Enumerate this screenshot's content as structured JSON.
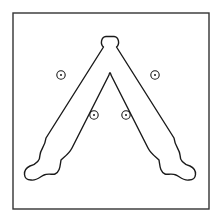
{
  "diagram": {
    "type": "technical-line-drawing",
    "canvas": {
      "width": 219,
      "height": 219,
      "background": "#ffffff"
    },
    "stroke_color": "#1a1a1a",
    "frame": {
      "x": 13,
      "y": 13,
      "width": 196,
      "height": 196,
      "stroke_width": 1.4,
      "stroke_color": "#333333"
    },
    "part_outline": {
      "stroke_width": 1.4,
      "path": "M 103.5 47 C 100 44 101 37 106 36.5 L 114 36.5 C 119 37 120 44 116.5 47 L 174 138 C 175 147 180 150 180 155 C 180 160 183 164 190 166 C 198 170 197 180 189 180 C 183 181 179 176 176 175 C 172 173 167 175 165 174 C 160 172 160 166 159 160 C 156 157 151 154 148 148 L 111 75 C 110.5 72 109.5 72 109 75 L 72 148 C 69 154 64 157 61 160 C 60 166 60 172 55 174 C 53 175 48 173 44 175 C 41 176 37 181 31 180 C 23 180 22 170 30 166 C 37 164 40 160 40 155 C 40 150 45 147 46 138 Z"
    },
    "holes": [
      {
        "name": "hole-upper-left",
        "cx": 61,
        "cy": 75,
        "r": 4.2,
        "dot_r": 1
      },
      {
        "name": "hole-upper-right",
        "cx": 155,
        "cy": 75,
        "r": 4.2,
        "dot_r": 1
      },
      {
        "name": "hole-lower-left",
        "cx": 94,
        "cy": 115,
        "r": 4.2,
        "dot_r": 1
      },
      {
        "name": "hole-lower-right",
        "cx": 126,
        "cy": 115,
        "r": 4.2,
        "dot_r": 1
      }
    ]
  }
}
